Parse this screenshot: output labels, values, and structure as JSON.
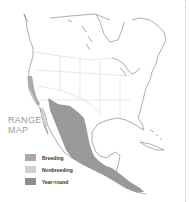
{
  "map": {
    "title_line1": "RANGE",
    "title_line2": "MAP",
    "legend": [
      {
        "label": "Breeding",
        "color": "#a9a9a9"
      },
      {
        "label": "Nonbreeding",
        "color": "#cfcfcf"
      },
      {
        "label": "Year-round",
        "color": "#8e8e8e"
      }
    ],
    "region": "North and Central America"
  }
}
